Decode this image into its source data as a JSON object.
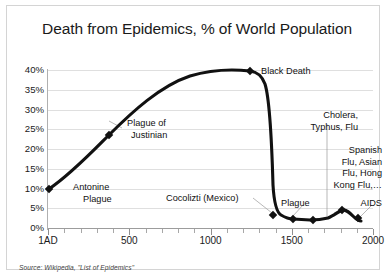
{
  "chart": {
    "title": "Death from Epidemics, % of World Population",
    "source_note": "Source: Wikipedia, \"List of Epidemics\""
  },
  "axes": {
    "y_tick_labels": [
      "40%",
      "35%",
      "30%",
      "25%",
      "20%",
      "15%",
      "10%",
      "5%",
      "0%"
    ],
    "x_tick_labels": [
      "1AD",
      "500",
      "1000",
      "1500",
      "2000"
    ]
  },
  "annotations": {
    "antonine": "Antonine\nPlague",
    "antonine_line1": "Antonine",
    "antonine_line2": "Plague",
    "justinian_line1": "Plague of",
    "justinian_line2": "Justinian",
    "black_death": "Black Death",
    "cocolizti": "Cocolizti (Mexico)",
    "plague": "Plague",
    "cholera_line1": "Cholera,",
    "cholera_line2": "Typhus, Flu",
    "modern_line1": "Spanish",
    "modern_line2": "Flu, Asian",
    "modern_line3": "Flu, Hong",
    "modern_line4": "Kong Flu,…",
    "aids": "AIDS"
  },
  "chart_data": {
    "type": "line",
    "title": "Death from Epidemics, % of World Population",
    "xlabel": "",
    "ylabel": "% of World Population",
    "xlim": [
      1,
      2050
    ],
    "ylim": [
      0,
      42
    ],
    "ytick_values": [
      0,
      5,
      10,
      15,
      20,
      25,
      30,
      35,
      40
    ],
    "ytick_labels": [
      "0%",
      "5%",
      "10%",
      "15%",
      "20%",
      "25%",
      "30%",
      "35%",
      "40%"
    ],
    "xtick_values": [
      1,
      500,
      1000,
      1500,
      2000
    ],
    "xtick_labels": [
      "1AD",
      "500",
      "1000",
      "1500",
      "2000"
    ],
    "grid": "horizontal",
    "legend": "none",
    "line_color": "#111111",
    "series": [
      {
        "name": "Death from epidemics, % of world population",
        "x": [
          165,
          541,
          1000,
          1347,
          1400,
          1545,
          1650,
          1800,
          1918,
          1985,
          2010
        ],
        "values": [
          10,
          26,
          35,
          39,
          38.5,
          2.2,
          1.5,
          1.6,
          3.2,
          2.0,
          1.9
        ],
        "markers": [
          {
            "x": 165,
            "y": 10,
            "label": "Antonine Plague"
          },
          {
            "x": 541,
            "y": 26,
            "label": "Plague of Justinian"
          },
          {
            "x": 1347,
            "y": 39,
            "label": "Black Death"
          },
          {
            "x": 1545,
            "y": 2.2,
            "label": "Cocolizti (Mexico)"
          },
          {
            "x": 1650,
            "y": 1.5,
            "label": "Plague"
          },
          {
            "x": 1800,
            "y": 1.6,
            "label": "Cholera, Typhus, Flu"
          },
          {
            "x": 1918,
            "y": 3.2,
            "label": "Spanish Flu, Asian Flu, Hong Kong Flu,…"
          },
          {
            "x": 1985,
            "y": 2.0,
            "label": "AIDS"
          }
        ]
      }
    ],
    "annotations": [
      {
        "text": "Antonine Plague",
        "x": 165,
        "y": 10
      },
      {
        "text": "Plague of Justinian",
        "x": 541,
        "y": 26
      },
      {
        "text": "Black Death",
        "x": 1347,
        "y": 39
      },
      {
        "text": "Cocolizti (Mexico)",
        "x": 1545,
        "y": 2.2
      },
      {
        "text": "Plague",
        "x": 1650,
        "y": 1.5
      },
      {
        "text": "Cholera, Typhus, Flu",
        "x": 1800,
        "y": 1.6
      },
      {
        "text": "Spanish Flu, Asian Flu, Hong Kong Flu,…",
        "x": 1918,
        "y": 3.2
      },
      {
        "text": "AIDS",
        "x": 1985,
        "y": 2.0
      }
    ]
  }
}
